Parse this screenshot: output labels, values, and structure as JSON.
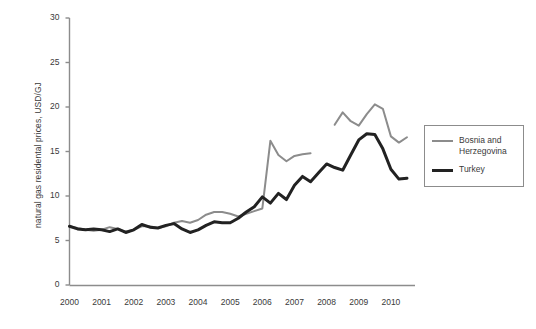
{
  "chart_data": {
    "type": "line",
    "title": "",
    "subtitle": "",
    "xlabel": "",
    "ylabel": "natural gas residental prices, USD/GJ",
    "xlim": [
      2000,
      2010.75
    ],
    "ylim": [
      0,
      30
    ],
    "yticks": [
      0,
      5,
      10,
      15,
      20,
      25,
      30
    ],
    "ytick_labels": [
      "0",
      "5",
      "10",
      "15",
      "20",
      "25",
      "30"
    ],
    "xticks": [
      2000,
      2001,
      2002,
      2003,
      2004,
      2005,
      2006,
      2007,
      2008,
      2009,
      2010
    ],
    "xtick_labels": [
      "2000",
      "2001",
      "2002",
      "2003",
      "2004",
      "2005",
      "2006",
      "2007",
      "2008",
      "2009",
      "2010"
    ],
    "grid": false,
    "legend_position": "right",
    "series": [
      {
        "name": "Bosnia and Herzegovina",
        "legend_label": "Bosnia and\nHerzegovina",
        "color": "#8c8c8c",
        "line_width": 2,
        "x": [
          2000.0,
          2000.25,
          2000.5,
          2000.75,
          2001.0,
          2001.25,
          2001.5,
          2001.75,
          2002.0,
          2002.25,
          2002.5,
          2002.75,
          2003.0,
          2003.25,
          2003.5,
          2003.75,
          2004.0,
          2004.25,
          2004.5,
          2004.75,
          2005.0,
          2005.25,
          2005.5,
          2005.75,
          2006.0,
          2006.25,
          2006.5,
          2006.75,
          2007.0,
          2007.25,
          2007.5
        ],
        "values": [
          6.6,
          6.4,
          6.2,
          6.1,
          6.2,
          6.5,
          6.3,
          6.0,
          6.2,
          6.6,
          6.6,
          6.4,
          6.6,
          7.0,
          7.2,
          7.0,
          7.3,
          7.9,
          8.2,
          8.2,
          8.0,
          7.7,
          8.0,
          8.3,
          8.6,
          16.2,
          14.6,
          13.9,
          14.5,
          14.7,
          14.8
        ]
      },
      {
        "name": "Bosnia and Herzegovina (cont.)",
        "legend_label": "",
        "color": "#8c8c8c",
        "line_width": 2,
        "x": [
          2008.25,
          2008.5,
          2008.75,
          2009.0,
          2009.25,
          2009.5,
          2009.75,
          2010.0,
          2010.25,
          2010.5
        ],
        "values": [
          18.0,
          19.4,
          18.4,
          17.9,
          19.2,
          20.3,
          19.8,
          16.7,
          16.0,
          16.6
        ]
      },
      {
        "name": "Turkey",
        "legend_label": "Turkey",
        "color": "#222222",
        "line_width": 3,
        "x": [
          2000.0,
          2000.25,
          2000.5,
          2000.75,
          2001.0,
          2001.25,
          2001.5,
          2001.75,
          2002.0,
          2002.25,
          2002.5,
          2002.75,
          2003.0,
          2003.25,
          2003.5,
          2003.75,
          2004.0,
          2004.25,
          2004.5,
          2004.75,
          2005.0,
          2005.25,
          2005.5,
          2005.75,
          2006.0,
          2006.25,
          2006.5,
          2006.75,
          2007.0,
          2007.25,
          2007.5,
          2007.75,
          2008.0,
          2008.25,
          2008.5,
          2008.75,
          2009.0,
          2009.25,
          2009.5,
          2009.75,
          2010.0,
          2010.25,
          2010.5
        ],
        "values": [
          6.6,
          6.3,
          6.2,
          6.3,
          6.2,
          6.0,
          6.3,
          5.9,
          6.2,
          6.8,
          6.5,
          6.4,
          6.7,
          6.9,
          6.3,
          5.9,
          6.2,
          6.7,
          7.1,
          7.0,
          7.0,
          7.5,
          8.2,
          8.8,
          9.9,
          9.2,
          10.3,
          9.6,
          11.2,
          12.2,
          11.6,
          12.6,
          13.6,
          13.2,
          12.9,
          14.6,
          16.3,
          17.0,
          16.9,
          15.3,
          13.0,
          11.9,
          12.0
        ]
      }
    ]
  },
  "legend": {
    "items": [
      {
        "label": "Bosnia and\nHerzegovina",
        "color": "#8c8c8c"
      },
      {
        "label": "Turkey",
        "color": "#222222"
      }
    ]
  },
  "axes": {
    "y_title": "natural gas residental prices, USD/GJ"
  }
}
